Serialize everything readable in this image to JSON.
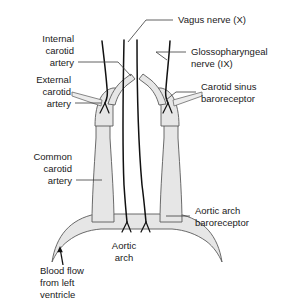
{
  "figure": {
    "background_color": "#ffffff",
    "vessel_fill_color": "#e6e6e6",
    "vessel_outline_color": "#5a5a5a",
    "nerve_color": "#111111",
    "label_color": "#1a1a1a",
    "leader_color": "#3a3a3a"
  },
  "labels": {
    "internal_carotid_artery": {
      "lines": [
        "Internal",
        "carotid",
        "artery"
      ],
      "line1": "Internal",
      "line2": "carotid",
      "line3": "artery",
      "align": "right"
    },
    "external_carotid_artery": {
      "lines": [
        "External",
        "carotid",
        "artery"
      ],
      "line1": "External",
      "line2": "carotid",
      "line3": "artery",
      "align": "right"
    },
    "common_carotid_artery": {
      "lines": [
        "Common",
        "carotid",
        "artery"
      ],
      "line1": "Common",
      "line2": "carotid",
      "line3": "artery",
      "align": "right"
    },
    "blood_flow_from_left_ventricle": {
      "lines": [
        "Blood flow",
        "from left",
        "ventricle"
      ],
      "line1": "Blood flow",
      "line2": "from left",
      "line3": "ventricle",
      "align": "left"
    },
    "vagus_nerve": {
      "lines": [
        "Vagus nerve (X)"
      ],
      "line1": "Vagus nerve (X)",
      "align": "left"
    },
    "glossopharyngeal_nerve": {
      "lines": [
        "Glossopharyngeal",
        "nerve (IX)"
      ],
      "line1": "Glossopharyngeal",
      "line2": "nerve (IX)",
      "align": "left"
    },
    "carotid_sinus_baroreceptor": {
      "lines": [
        "Carotid sinus",
        "baroreceptor"
      ],
      "line1": "Carotid sinus",
      "line2": "baroreceptor",
      "align": "left"
    },
    "aortic_arch_baroreceptor": {
      "lines": [
        "Aortic arch",
        "baroreceptor"
      ],
      "line1": "Aortic arch",
      "line2": "baroreceptor",
      "align": "left"
    },
    "aortic_arch": {
      "lines": [
        "Aortic",
        "arch"
      ],
      "line1": "Aortic",
      "line2": "arch",
      "align": "center"
    }
  }
}
